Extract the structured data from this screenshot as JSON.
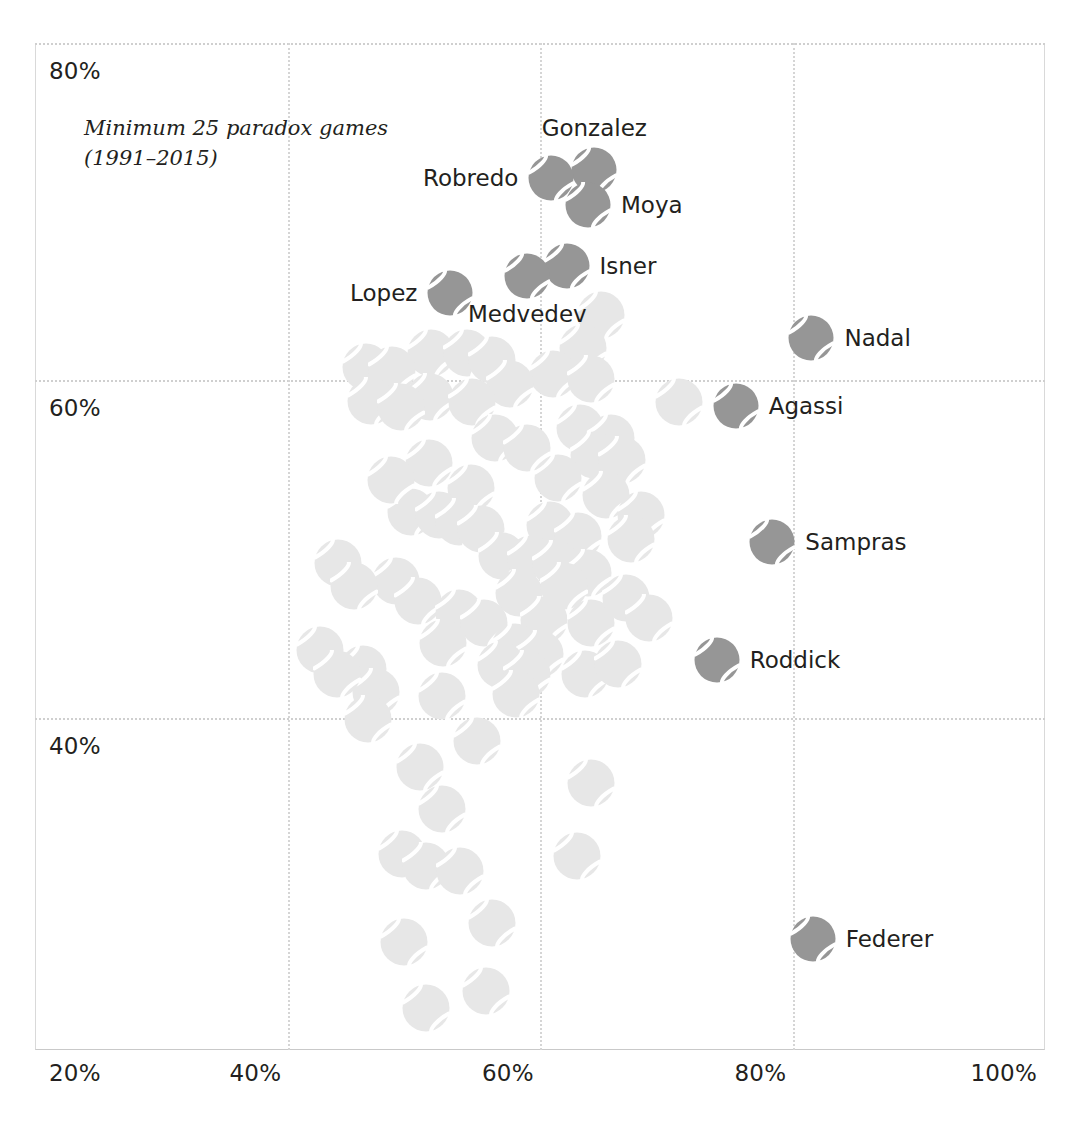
{
  "annotation": "Minimum 25 paradox games\n(1991–2015)",
  "axes": {
    "x_ticks": [
      {
        "label": "20%",
        "pct": 20
      },
      {
        "label": "40%",
        "pct": 40
      },
      {
        "label": "60%",
        "pct": 60
      },
      {
        "label": "80%",
        "pct": 80
      },
      {
        "label": "100%",
        "pct": 100
      }
    ],
    "y_ticks": [
      {
        "label": "80%",
        "pct": 80
      },
      {
        "label": "60%",
        "pct": 60
      },
      {
        "label": "40%",
        "pct": 40
      }
    ],
    "x_gridlines": [
      40,
      60,
      80
    ],
    "y_gridlines": [
      80,
      60,
      40
    ],
    "xlim": [
      20,
      100
    ],
    "ylim": [
      20.3,
      80
    ],
    "grid": true
  },
  "colors": {
    "highlight": "#969696",
    "muted": "#e7e7e7",
    "seam": "#ffffff",
    "text": "#231f20",
    "grid": "#d2d2d2"
  },
  "chart_data": {
    "type": "scatter",
    "title": "",
    "xlabel": "",
    "ylabel": "",
    "xlim": [
      20,
      100
    ],
    "ylim": [
      20.3,
      80
    ],
    "grid": true,
    "legend": "none",
    "marker": "tennis-ball",
    "annotations": [
      "Minimum 25 paradox games",
      "(1991–2015)"
    ],
    "points": [
      {
        "name": "Gonzalez",
        "x": 64.3,
        "y": 72.5,
        "highlight": true,
        "label_pos": "above"
      },
      {
        "name": "Moya",
        "x": 63.8,
        "y": 70.4,
        "highlight": true,
        "label_pos": "right"
      },
      {
        "name": "Robredo",
        "x": 60.9,
        "y": 72.0,
        "highlight": true,
        "label_pos": "left"
      },
      {
        "name": "Isner",
        "x": 62.1,
        "y": 66.8,
        "highlight": true,
        "label_pos": "right"
      },
      {
        "name": "Medvedev",
        "x": 59.0,
        "y": 66.2,
        "highlight": true,
        "label_pos": "below"
      },
      {
        "name": "Lopez",
        "x": 52.9,
        "y": 65.2,
        "highlight": true,
        "label_pos": "left"
      },
      {
        "name": "Nadal",
        "x": 81.5,
        "y": 62.5,
        "highlight": true,
        "label_pos": "right"
      },
      {
        "name": "Agassi",
        "x": 75.5,
        "y": 58.5,
        "highlight": true,
        "label_pos": "right"
      },
      {
        "name": "Sampras",
        "x": 78.4,
        "y": 50.4,
        "highlight": true,
        "label_pos": "right"
      },
      {
        "name": "Roddick",
        "x": 74.0,
        "y": 43.4,
        "highlight": true,
        "label_pos": "right"
      },
      {
        "name": "Federer",
        "x": 81.6,
        "y": 26.9,
        "highlight": true,
        "label_pos": "right"
      },
      {
        "name": "",
        "x": 64.8,
        "y": 63.9,
        "highlight": false
      },
      {
        "name": "",
        "x": 51.4,
        "y": 61.6,
        "highlight": false
      },
      {
        "name": "",
        "x": 54.2,
        "y": 61.6,
        "highlight": false
      },
      {
        "name": "",
        "x": 56.2,
        "y": 61.2,
        "highlight": false
      },
      {
        "name": "",
        "x": 63.4,
        "y": 61.9,
        "highlight": false
      },
      {
        "name": "",
        "x": 61.0,
        "y": 60.4,
        "highlight": false
      },
      {
        "name": "",
        "x": 64.0,
        "y": 60.1,
        "highlight": false
      },
      {
        "name": "",
        "x": 57.6,
        "y": 59.8,
        "highlight": false
      },
      {
        "name": "",
        "x": 51.3,
        "y": 59.0,
        "highlight": false
      },
      {
        "name": "",
        "x": 54.6,
        "y": 58.7,
        "highlight": false
      },
      {
        "name": "",
        "x": 71.0,
        "y": 58.7,
        "highlight": false
      },
      {
        "name": "",
        "x": 63.2,
        "y": 57.2,
        "highlight": false
      },
      {
        "name": "",
        "x": 65.6,
        "y": 56.6,
        "highlight": false
      },
      {
        "name": "",
        "x": 64.3,
        "y": 55.6,
        "highlight": false
      },
      {
        "name": "",
        "x": 66.5,
        "y": 55.3,
        "highlight": false
      },
      {
        "name": "",
        "x": 51.2,
        "y": 55.1,
        "highlight": false
      },
      {
        "name": "",
        "x": 61.4,
        "y": 54.2,
        "highlight": false
      },
      {
        "name": "",
        "x": 54.5,
        "y": 53.6,
        "highlight": false
      },
      {
        "name": "",
        "x": 65.2,
        "y": 53.2,
        "highlight": false
      },
      {
        "name": "",
        "x": 49.8,
        "y": 52.2,
        "highlight": false
      },
      {
        "name": "",
        "x": 52.0,
        "y": 52.0,
        "highlight": false
      },
      {
        "name": "",
        "x": 53.6,
        "y": 51.6,
        "highlight": false
      },
      {
        "name": "",
        "x": 55.3,
        "y": 51.2,
        "highlight": false
      },
      {
        "name": "",
        "x": 60.8,
        "y": 51.4,
        "highlight": false
      },
      {
        "name": "",
        "x": 63.0,
        "y": 50.8,
        "highlight": false
      },
      {
        "name": "",
        "x": 57.0,
        "y": 49.6,
        "highlight": false
      },
      {
        "name": "",
        "x": 59.3,
        "y": 49.4,
        "highlight": false
      },
      {
        "name": "",
        "x": 61.3,
        "y": 49.1,
        "highlight": false
      },
      {
        "name": "",
        "x": 63.8,
        "y": 48.6,
        "highlight": false
      },
      {
        "name": "",
        "x": 48.6,
        "y": 48.1,
        "highlight": false
      },
      {
        "name": "",
        "x": 50.3,
        "y": 46.9,
        "highlight": false
      },
      {
        "name": "",
        "x": 58.3,
        "y": 47.4,
        "highlight": false
      },
      {
        "name": "",
        "x": 53.6,
        "y": 46.2,
        "highlight": false
      },
      {
        "name": "",
        "x": 55.6,
        "y": 45.6,
        "highlight": false
      },
      {
        "name": "",
        "x": 60.3,
        "y": 45.8,
        "highlight": false
      },
      {
        "name": "",
        "x": 64.0,
        "y": 45.6,
        "highlight": false
      },
      {
        "name": "",
        "x": 52.3,
        "y": 44.4,
        "highlight": false
      },
      {
        "name": "",
        "x": 58.0,
        "y": 44.2,
        "highlight": false
      },
      {
        "name": "",
        "x": 60.0,
        "y": 43.8,
        "highlight": false
      },
      {
        "name": "",
        "x": 46.0,
        "y": 42.9,
        "highlight": false
      },
      {
        "name": "",
        "x": 56.9,
        "y": 43.1,
        "highlight": false
      },
      {
        "name": "",
        "x": 59.0,
        "y": 42.6,
        "highlight": false
      },
      {
        "name": "",
        "x": 63.6,
        "y": 42.6,
        "highlight": false
      },
      {
        "name": "",
        "x": 47.0,
        "y": 41.5,
        "highlight": false
      },
      {
        "name": "",
        "x": 52.2,
        "y": 41.3,
        "highlight": false
      },
      {
        "name": "",
        "x": 58.1,
        "y": 41.4,
        "highlight": false
      },
      {
        "name": "",
        "x": 46.4,
        "y": 39.9,
        "highlight": false
      },
      {
        "name": "",
        "x": 55.0,
        "y": 38.6,
        "highlight": false
      },
      {
        "name": "",
        "x": 50.5,
        "y": 37.1,
        "highlight": false
      },
      {
        "name": "",
        "x": 64.0,
        "y": 36.1,
        "highlight": false
      },
      {
        "name": "",
        "x": 52.2,
        "y": 34.6,
        "highlight": false
      },
      {
        "name": "",
        "x": 49.1,
        "y": 31.9,
        "highlight": false
      },
      {
        "name": "",
        "x": 51.0,
        "y": 31.2,
        "highlight": false
      },
      {
        "name": "",
        "x": 53.7,
        "y": 30.9,
        "highlight": false
      },
      {
        "name": "",
        "x": 62.9,
        "y": 31.8,
        "highlight": false
      },
      {
        "name": "",
        "x": 56.2,
        "y": 27.8,
        "highlight": false
      },
      {
        "name": "",
        "x": 49.2,
        "y": 26.7,
        "highlight": false
      },
      {
        "name": "",
        "x": 46.2,
        "y": 60.8,
        "highlight": false
      },
      {
        "name": "",
        "x": 48.3,
        "y": 60.6,
        "highlight": false
      },
      {
        "name": "",
        "x": 46.6,
        "y": 58.8,
        "highlight": false
      },
      {
        "name": "",
        "x": 49.0,
        "y": 58.4,
        "highlight": false
      },
      {
        "name": "",
        "x": 44.0,
        "y": 49.2,
        "highlight": false
      },
      {
        "name": "",
        "x": 45.3,
        "y": 47.8,
        "highlight": false
      },
      {
        "name": "",
        "x": 42.6,
        "y": 44.0,
        "highlight": false
      },
      {
        "name": "",
        "x": 43.9,
        "y": 42.6,
        "highlight": false
      },
      {
        "name": "",
        "x": 66.8,
        "y": 47.1,
        "highlight": false
      },
      {
        "name": "",
        "x": 66.2,
        "y": 43.2,
        "highlight": false
      },
      {
        "name": "",
        "x": 68.6,
        "y": 45.9,
        "highlight": false
      },
      {
        "name": "",
        "x": 68.0,
        "y": 52.0,
        "highlight": false
      },
      {
        "name": "",
        "x": 67.2,
        "y": 50.6,
        "highlight": false
      },
      {
        "name": "",
        "x": 56.4,
        "y": 56.6,
        "highlight": false
      },
      {
        "name": "",
        "x": 59.0,
        "y": 56.0,
        "highlight": false
      },
      {
        "name": "",
        "x": 48.2,
        "y": 54.1,
        "highlight": false
      },
      {
        "name": "",
        "x": 61.9,
        "y": 47.8,
        "highlight": false
      },
      {
        "name": "",
        "x": 55.7,
        "y": 23.8,
        "highlight": false
      },
      {
        "name": "",
        "x": 51.0,
        "y": 22.8,
        "highlight": false
      }
    ]
  }
}
